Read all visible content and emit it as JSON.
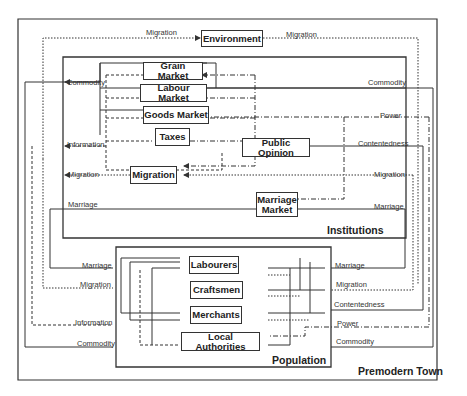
{
  "diagram": {
    "title": "Premodern Town",
    "regions": {
      "outer": "Premodern Town",
      "institutions": "Institutions",
      "population": "Population"
    },
    "nodes": {
      "environment": "Environment",
      "grain_market": "Grain Market",
      "labour_market": "Labour Market",
      "goods_market": "Goods Market",
      "taxes": "Taxes",
      "public_opinion": "Public Opinion",
      "migration": "Migration",
      "marriage_market": "Marriage Market",
      "labourers": "Labourers",
      "craftsmen": "Craftsmen",
      "merchants": "Merchants",
      "local_authorities": "Local Authorities"
    },
    "flow_labels": {
      "env_in_migration": "Migration",
      "env_out_migration": "Migration",
      "inst_left_commodity": "Commodity",
      "inst_left_information": "Information",
      "inst_left_migration": "Migration",
      "inst_left_marriage": "Marriage",
      "inst_right_commodity": "Commodity",
      "inst_right_power": "Power",
      "inst_right_contentedness": "Contentedness",
      "inst_right_migration": "Migration",
      "inst_right_marriage": "Marriage",
      "pop_left_marriage": "Marriage",
      "pop_left_migration": "Migration",
      "pop_left_information": "Information",
      "pop_left_commodity": "Commodity",
      "pop_right_marriage": "Marriage",
      "pop_right_migration": "Migration",
      "pop_right_contentedness": "Contentedness",
      "pop_right_power": "Power",
      "pop_right_commodity": "Commodity"
    },
    "line_styles": {
      "Commodity": "solid",
      "Marriage": "solid",
      "Contentedness": "solid",
      "Migration": "dotted",
      "Information": "dashed",
      "Power": "dash-dot"
    },
    "colors": {
      "line": "#333333",
      "background": "#ffffff"
    }
  }
}
